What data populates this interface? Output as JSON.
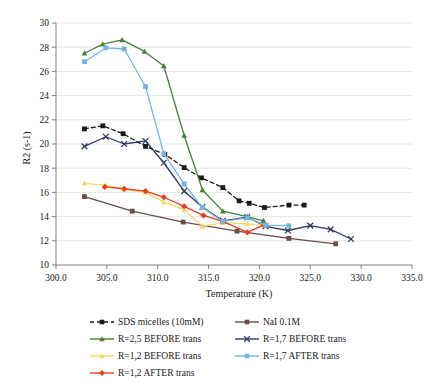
{
  "chart_data": {
    "type": "line",
    "title": "",
    "xlabel": "Temperature (K)",
    "ylabel": "R2 (s-1)",
    "xlim": [
      300.0,
      335.0
    ],
    "ylim": [
      10,
      30
    ],
    "xticks": [
      "300.0",
      "305.0",
      "310.0",
      "315.0",
      "320.0",
      "325.0",
      "330.0",
      "335.0"
    ],
    "xtick_values": [
      300.0,
      305.0,
      310.0,
      315.0,
      320.0,
      325.0,
      330.0,
      335.0
    ],
    "yticks": [
      "10",
      "12",
      "14",
      "16",
      "18",
      "20",
      "22",
      "24",
      "26",
      "28",
      "30"
    ],
    "ytick_values": [
      10,
      12,
      14,
      16,
      18,
      20,
      22,
      24,
      26,
      28,
      30
    ],
    "grid": "horizontal",
    "legend_position": "below",
    "series": [
      {
        "name": "SDS micelles (10mM)",
        "color": "#1a1a1a",
        "marker": "square",
        "dash": "4,3",
        "x": [
          302.8,
          304.6,
          306.6,
          308.8,
          310.7,
          312.6,
          314.3,
          316.4,
          318.0,
          319.0,
          320.5,
          322.9,
          324.4
        ],
        "y": [
          21.25,
          21.5,
          20.85,
          19.8,
          19.15,
          18.05,
          17.2,
          16.4,
          15.3,
          15.1,
          14.75,
          14.95,
          14.95
        ]
      },
      {
        "name": "NaI 0.1M",
        "color": "#6b4a4a",
        "marker": "square",
        "dash": "none",
        "x": [
          302.8,
          307.5,
          312.5,
          317.8,
          322.9,
          327.5
        ],
        "y": [
          15.65,
          14.45,
          13.55,
          12.8,
          12.2,
          11.75
        ]
      },
      {
        "name": "R=2,5 BEFORE trans",
        "color": "#4a7f3f",
        "marker": "triangle",
        "dash": "none",
        "x": [
          302.8,
          304.6,
          306.5,
          308.7,
          310.6,
          312.6,
          314.4,
          316.4,
          318.8,
          320.4
        ],
        "y": [
          27.5,
          28.25,
          28.6,
          27.65,
          26.45,
          20.7,
          16.2,
          14.45,
          14.0,
          13.65
        ]
      },
      {
        "name": "R=1,7 BEFORE trans",
        "color": "#2e3a66",
        "marker": "cross",
        "dash": "none",
        "x": [
          302.8,
          304.9,
          306.7,
          308.8,
          310.6,
          312.6,
          314.4,
          316.4,
          318.8,
          320.6,
          322.8,
          325.0,
          327.0,
          329.0
        ],
        "y": [
          19.8,
          20.6,
          20.0,
          20.25,
          18.45,
          16.1,
          14.8,
          13.65,
          13.95,
          13.2,
          12.85,
          13.25,
          12.95,
          12.15
        ]
      },
      {
        "name": "R=1,2 BEFORE trans",
        "color": "#f5d96b",
        "marker": "triangle",
        "dash": "none",
        "x": [
          302.8,
          304.9,
          306.7,
          308.8,
          310.6,
          312.6,
          314.4,
          316.4,
          318.8,
          320.4
        ],
        "y": [
          16.75,
          16.6,
          16.25,
          16.0,
          15.2,
          14.55,
          13.2,
          13.5,
          13.4,
          13.3
        ]
      },
      {
        "name": "R=1,2 AFTER trans",
        "color": "#e8401f",
        "marker": "diamond",
        "dash": "none",
        "x": [
          304.8,
          306.7,
          308.8,
          310.6,
          312.6,
          314.5,
          316.4,
          318.8,
          320.4
        ],
        "y": [
          16.45,
          16.3,
          16.1,
          15.6,
          14.85,
          14.1,
          13.6,
          12.7,
          13.3
        ]
      },
      {
        "name": "R=1,7 AFTER trans",
        "color": "#73b5e0",
        "marker": "square",
        "dash": "none",
        "x": [
          302.8,
          304.9,
          306.7,
          308.8,
          310.6,
          312.6,
          314.4,
          316.4,
          318.8,
          320.6,
          322.9
        ],
        "y": [
          26.8,
          27.95,
          27.85,
          24.75,
          19.2,
          16.7,
          14.75,
          13.6,
          13.9,
          13.3,
          13.25
        ]
      }
    ],
    "legend": [
      {
        "label": "SDS micelles (10mM)",
        "color": "#1a1a1a",
        "marker": "square",
        "dash": "4,3",
        "col": 0,
        "row": 0
      },
      {
        "label": "NaI 0.1M",
        "color": "#6b4a4a",
        "marker": "square",
        "dash": "none",
        "col": 1,
        "row": 0
      },
      {
        "label": "R=2,5 BEFORE trans",
        "color": "#4a7f3f",
        "marker": "triangle",
        "dash": "none",
        "col": 0,
        "row": 1
      },
      {
        "label": "R=1,7 BEFORE trans",
        "color": "#2e3a66",
        "marker": "cross",
        "dash": "none",
        "col": 1,
        "row": 1
      },
      {
        "label": "R=1,2 BEFORE trans",
        "color": "#f5d96b",
        "marker": "triangle",
        "dash": "none",
        "col": 0,
        "row": 2
      },
      {
        "label": "R=1,7 AFTER trans",
        "color": "#73b5e0",
        "marker": "square",
        "dash": "none",
        "col": 1,
        "row": 2
      },
      {
        "label": "R=1,2 AFTER trans",
        "color": "#e8401f",
        "marker": "diamond",
        "dash": "none",
        "col": 0,
        "row": 3
      }
    ]
  }
}
